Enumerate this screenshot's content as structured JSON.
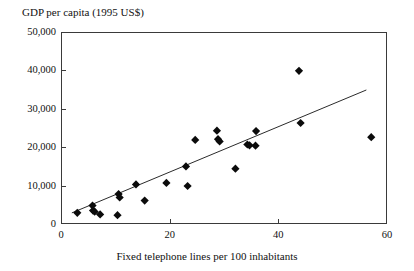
{
  "chart_data": {
    "type": "scatter",
    "title": "GDP per capita (1995 US$)",
    "xlabel": "Fixed telephone lines per 100 inhabitants",
    "ylabel": "GDP per capita (1995 US$)",
    "xlim": [
      0,
      60
    ],
    "ylim": [
      0,
      50000
    ],
    "grid": false,
    "legend": null,
    "xticks": [
      0,
      20,
      40,
      60
    ],
    "xtick_labels": [
      "0",
      "20",
      "40",
      "60"
    ],
    "yticks": [
      0,
      10000,
      20000,
      30000,
      40000,
      50000
    ],
    "ytick_labels": [
      "0",
      "10,000",
      "20,000",
      "30,000",
      "40,000",
      "50,000"
    ],
    "series": [
      {
        "name": "countries",
        "marker": "diamond",
        "color": "#0b0b0b",
        "points": [
          {
            "x": 3.0,
            "y": 2900
          },
          {
            "x": 5.8,
            "y": 4800
          },
          {
            "x": 5.9,
            "y": 3500
          },
          {
            "x": 6.2,
            "y": 3200
          },
          {
            "x": 7.2,
            "y": 2500
          },
          {
            "x": 10.4,
            "y": 2300
          },
          {
            "x": 10.6,
            "y": 7800
          },
          {
            "x": 10.8,
            "y": 6900
          },
          {
            "x": 13.8,
            "y": 10300
          },
          {
            "x": 15.4,
            "y": 6100
          },
          {
            "x": 19.4,
            "y": 10700
          },
          {
            "x": 23.0,
            "y": 15000
          },
          {
            "x": 23.3,
            "y": 9900
          },
          {
            "x": 24.7,
            "y": 21900
          },
          {
            "x": 28.7,
            "y": 24300
          },
          {
            "x": 28.9,
            "y": 22100
          },
          {
            "x": 29.2,
            "y": 21500
          },
          {
            "x": 32.1,
            "y": 14400
          },
          {
            "x": 34.3,
            "y": 20700
          },
          {
            "x": 34.7,
            "y": 20500
          },
          {
            "x": 35.8,
            "y": 20400
          },
          {
            "x": 35.9,
            "y": 24200
          },
          {
            "x": 43.8,
            "y": 39900
          },
          {
            "x": 44.1,
            "y": 26300
          },
          {
            "x": 57.1,
            "y": 22600
          }
        ]
      }
    ],
    "trendline": {
      "type": "linear",
      "x_start": 2.0,
      "y_start": 2900,
      "x_end": 56.2,
      "y_end": 34900
    }
  }
}
